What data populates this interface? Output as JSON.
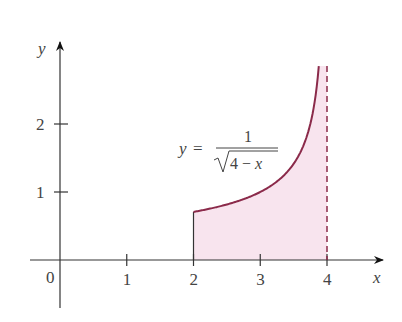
{
  "chart_data": {
    "type": "area",
    "title": "",
    "function_label": {
      "lhs": "y",
      "eq": "=",
      "numerator": "1",
      "denominator": "4 − x",
      "sqrt": true
    },
    "xlabel": "x",
    "ylabel": "y",
    "origin_label": "0",
    "x_ticks": [
      1,
      2,
      3,
      4
    ],
    "x_tick_labels": [
      "1",
      "2",
      "3",
      "4"
    ],
    "y_ticks": [
      1,
      2
    ],
    "y_tick_labels": [
      "1",
      "2"
    ],
    "xlim": [
      -0.1,
      4.8
    ],
    "ylim": [
      -0.7,
      3.2
    ],
    "grid": false,
    "shaded_region": {
      "x_from": 2,
      "x_to": 4,
      "description": "area under y = 1/sqrt(4-x) from x=2 to x=4"
    },
    "asymptote": {
      "x": 4,
      "style": "dashed"
    },
    "series": [
      {
        "name": "y = 1/√(4−x)",
        "x": [
          2.0,
          2.5,
          3.0,
          3.25,
          3.5,
          3.7,
          3.8,
          3.877
        ],
        "y": [
          0.707,
          0.816,
          1.0,
          1.155,
          1.414,
          1.826,
          2.236,
          2.85
        ]
      }
    ],
    "colors": {
      "curve": "#8b2a4a",
      "fill": "#f8e4ee",
      "axes": "#333333"
    }
  }
}
